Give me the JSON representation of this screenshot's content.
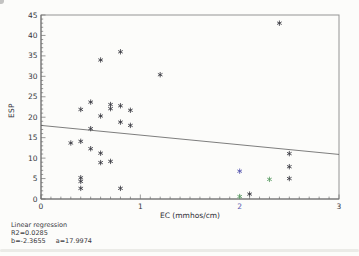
{
  "figure": {
    "background": "#fcfcfa",
    "annotation": {
      "title": "Linear regression",
      "r2_text": "R2=0.0285",
      "b_text": "b=-2.3655",
      "a_text": "a=17.9974"
    }
  },
  "chart_data": {
    "type": "scatter",
    "title": "",
    "xlabel": "EC (mmhos/cm)",
    "ylabel": "ESP",
    "xlim": [
      0,
      3
    ],
    "ylim": [
      0,
      45
    ],
    "grid": false,
    "legend_position": "none",
    "x_major_ticks": [
      {
        "v": 0,
        "label": "0"
      },
      {
        "v": 1,
        "label": "1"
      },
      {
        "v": 2,
        "label": "2",
        "color": "#5a5ab0"
      },
      {
        "v": 3,
        "label": "3"
      }
    ],
    "x_minor_step": 0.1,
    "y_major_ticks": [
      {
        "v": 0,
        "label": "0"
      },
      {
        "v": 5,
        "label": "5"
      },
      {
        "v": 10,
        "label": "10"
      },
      {
        "v": 15,
        "label": "15"
      },
      {
        "v": 20,
        "label": "20"
      },
      {
        "v": 25,
        "label": "25"
      },
      {
        "v": 30,
        "label": "30"
      },
      {
        "v": 35,
        "label": "35"
      },
      {
        "v": 40,
        "label": "40"
      },
      {
        "v": 45,
        "label": "45"
      }
    ],
    "y_minor_step": 1,
    "regression": {
      "slope_b": -2.3655,
      "intercept_a": 17.9974,
      "r2": 0.0285,
      "x_start": 0,
      "x_end": 3
    },
    "series": [
      {
        "name": "samples-dark",
        "marker": "asterisk",
        "color": "#3e3e46",
        "points": [
          [
            0.3,
            13.7
          ],
          [
            0.4,
            21.9
          ],
          [
            0.4,
            14.1
          ],
          [
            0.4,
            5.2
          ],
          [
            0.4,
            4.3
          ],
          [
            0.4,
            2.6
          ],
          [
            0.5,
            23.7
          ],
          [
            0.5,
            17.2
          ],
          [
            0.5,
            12.3
          ],
          [
            0.6,
            34.0
          ],
          [
            0.6,
            20.3
          ],
          [
            0.6,
            11.2
          ],
          [
            0.6,
            8.9
          ],
          [
            0.7,
            23.1
          ],
          [
            0.7,
            22.1
          ],
          [
            0.7,
            9.2
          ],
          [
            0.8,
            36.0
          ],
          [
            0.8,
            22.8
          ],
          [
            0.8,
            18.8
          ],
          [
            0.8,
            2.6
          ],
          [
            0.9,
            21.7
          ],
          [
            0.9,
            18.0
          ],
          [
            1.2,
            30.4
          ],
          [
            2.1,
            1.2
          ],
          [
            2.4,
            43.0
          ],
          [
            2.5,
            11.1
          ],
          [
            2.5,
            7.9
          ],
          [
            2.5,
            5.0
          ]
        ]
      },
      {
        "name": "sample-blue",
        "marker": "asterisk",
        "color": "#5a5ab0",
        "points": [
          [
            2.0,
            6.8
          ]
        ]
      },
      {
        "name": "samples-green",
        "marker": "asterisk",
        "color": "#5f9e68",
        "points": [
          [
            2.3,
            4.8
          ],
          [
            2.0,
            0.6
          ]
        ]
      }
    ],
    "colors": {
      "frame": "#949494",
      "axis": "#6f6f6f",
      "regression_line": "#5d5d5d",
      "tick_label": "#36363c"
    }
  }
}
